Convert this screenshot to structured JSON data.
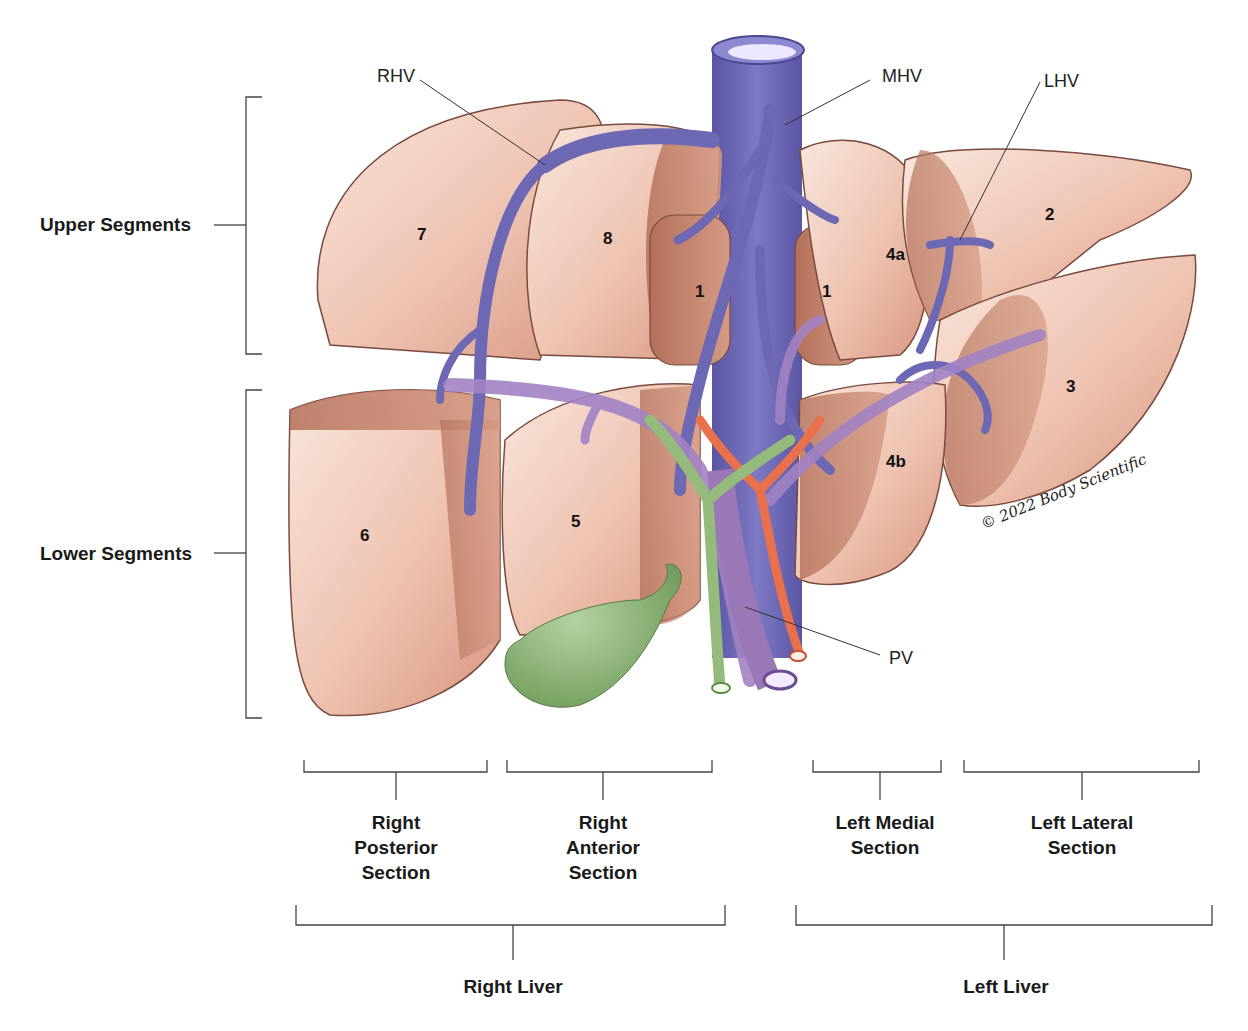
{
  "diagram": {
    "side_labels": {
      "upper": "Upper Segments",
      "lower": "Lower Segments"
    },
    "vessel_labels": {
      "rhv": "RHV",
      "mhv": "MHV",
      "lhv": "LHV",
      "pv": "PV"
    },
    "segments": {
      "s1a": "1",
      "s1b": "1",
      "s2": "2",
      "s3": "3",
      "s4a": "4a",
      "s4b": "4b",
      "s5": "5",
      "s6": "6",
      "s7": "7",
      "s8": "8"
    },
    "sections": {
      "right_posterior": [
        "Right",
        "Posterior",
        "Section"
      ],
      "right_anterior": [
        "Right",
        "Anterior",
        "Section"
      ],
      "left_medial": [
        "Left Medial",
        "Section"
      ],
      "left_lateral": [
        "Left Lateral",
        "Section"
      ]
    },
    "livers": {
      "right": "Right Liver",
      "left": "Left Liver"
    },
    "copyright": "© 2022 Body Scientific",
    "colors": {
      "liver_light": "#f6dcd0",
      "liver_mid": "#e4aa96",
      "liver_dark": "#b8735c",
      "hepatic_vein": "#6d68b4",
      "portal_vein": "#9a78b8",
      "artery": "#e8704c",
      "bile_duct": "#94bb7c",
      "gallbladder": "#86ad6c",
      "line": "#444444"
    }
  }
}
